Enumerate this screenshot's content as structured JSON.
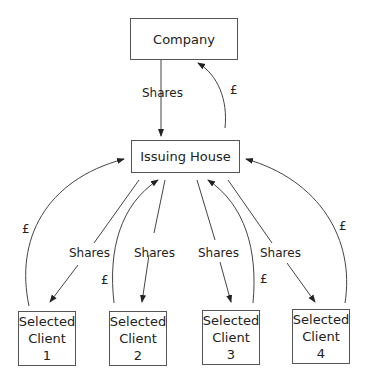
{
  "nodes": {
    "company": "Company",
    "issuing_house": "Issuing House",
    "clients": [
      {
        "line1": "Selected",
        "line2": "Client",
        "number": "1"
      },
      {
        "line1": "Selected",
        "line2": "Client",
        "number": "2"
      },
      {
        "line1": "Selected",
        "line2": "Client",
        "number": "3"
      },
      {
        "line1": "Selected",
        "line2": "Client",
        "number": "4"
      }
    ]
  },
  "edges": {
    "company_to_house": "Shares",
    "house_to_company": "£",
    "house_to_client_1": "Shares",
    "client_1_to_house": "£",
    "house_to_client_2": "Shares",
    "client_2_to_house": "£",
    "house_to_client_3": "Shares",
    "client_3_to_house": "£",
    "house_to_client_4": "Shares",
    "client_4_to_house": "£"
  }
}
